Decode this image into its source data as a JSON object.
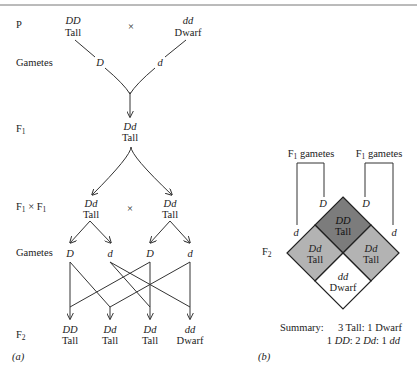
{
  "panel_a": {
    "caption": "(a)",
    "row_labels": {
      "p": "P",
      "gametes_1": "Gametes",
      "f1": "F",
      "f1_sub": "1",
      "f1xf1_a": "F",
      "f1xf1_sub_a": "1",
      "f1xf1_x": "×",
      "f1xf1_b": "F",
      "f1xf1_sub_b": "1",
      "gametes_2": "Gametes",
      "f2": "F",
      "f2_sub": "2"
    },
    "parents": {
      "left_genotype": "DD",
      "left_phenotype": "Tall",
      "cross": "×",
      "right_genotype": "dd",
      "right_phenotype": "Dwarf"
    },
    "parent_gametes": [
      "D",
      "d"
    ],
    "f1": {
      "genotype": "Dd",
      "phenotype": "Tall"
    },
    "f1_cross": {
      "left_genotype": "Dd",
      "left_phenotype": "Tall",
      "cross": "×",
      "right_genotype": "Dd",
      "right_phenotype": "Tall"
    },
    "f1_gametes": [
      "D",
      "d",
      "D",
      "d"
    ],
    "f2": [
      {
        "genotype": "DD",
        "phenotype": "Tall"
      },
      {
        "genotype": "Dd",
        "phenotype": "Tall"
      },
      {
        "genotype": "Dd",
        "phenotype": "Tall"
      },
      {
        "genotype": "dd",
        "phenotype": "Dwarf"
      }
    ]
  },
  "panel_b": {
    "caption": "(b)",
    "gamete_bracket_left": {
      "label": "F",
      "sub": "1",
      "label_rest": " gametes",
      "outer": "d",
      "inner": "D"
    },
    "gamete_bracket_right": {
      "label": "F",
      "sub": "1",
      "label_rest": " gametes",
      "inner": "D",
      "outer": "d"
    },
    "f2_label": "F",
    "f2_sub": "2",
    "cells": {
      "top": {
        "genotype": "DD",
        "phenotype": "Tall",
        "color": "#7c7c7c"
      },
      "left": {
        "genotype": "Dd",
        "phenotype": "Tall",
        "color": "#b3b3b3"
      },
      "right": {
        "genotype": "Dd",
        "phenotype": "Tall",
        "color": "#b3b3b3"
      },
      "bottom": {
        "genotype": "dd",
        "phenotype": "Dwarf",
        "color": "#ffffff"
      }
    },
    "summary": {
      "label": "Summary:",
      "phenotype_ratio": "3 Tall: 1 Dwarf",
      "genotype_ratio": {
        "n1": "1 ",
        "g1": "DD",
        "s1": ": 2 ",
        "g2": "Dd",
        "s2": ": 1 ",
        "g3": "dd"
      }
    }
  }
}
